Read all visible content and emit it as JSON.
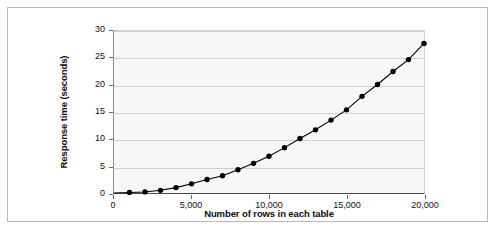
{
  "chart_data": {
    "type": "line",
    "title": "",
    "xlabel": "Number of rows in each table",
    "ylabel": "Response time (seconds)",
    "xlim": [
      0,
      20000
    ],
    "ylim": [
      0,
      30
    ],
    "grid": true,
    "legend": "none",
    "marker": "filled-circle",
    "line_color": "#000000",
    "marker_color": "#000000",
    "plot_background": "#f7f7f7",
    "gridline_color": "#cfcfcf",
    "xticks": [
      0,
      5000,
      10000,
      15000,
      20000
    ],
    "xtick_labels": [
      "0",
      "5,000",
      "10,000",
      "15,000",
      "20,000"
    ],
    "yticks": [
      0,
      5,
      10,
      15,
      20,
      25,
      30
    ],
    "ytick_labels": [
      "0",
      "5",
      "10",
      "15",
      "20",
      "25",
      "30"
    ],
    "x": [
      0,
      1000,
      2000,
      3000,
      4000,
      5000,
      6000,
      7000,
      8000,
      9000,
      10000,
      11000,
      12000,
      13000,
      14000,
      15000,
      16000,
      17000,
      18000,
      19000,
      20000
    ],
    "values": [
      0,
      0.1,
      0.2,
      0.5,
      1.0,
      1.7,
      2.5,
      3.2,
      4.3,
      5.5,
      6.8,
      8.4,
      10.1,
      11.7,
      13.5,
      15.4,
      17.9,
      20.1,
      22.5,
      24.7,
      27.7
    ],
    "series": [
      {
        "name": "Response time",
        "values": [
          0,
          0.1,
          0.2,
          0.5,
          1.0,
          1.7,
          2.5,
          3.2,
          4.3,
          5.5,
          6.8,
          8.4,
          10.1,
          11.7,
          13.5,
          15.4,
          17.9,
          20.1,
          22.5,
          24.7,
          27.7
        ]
      }
    ]
  }
}
